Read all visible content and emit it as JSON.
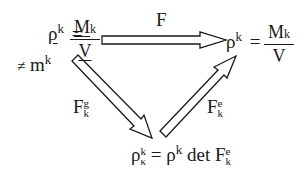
{
  "diagram": {
    "type": "commutative-triangle",
    "nodes": {
      "reference": {
        "symbol": "ρ",
        "sup": "k",
        "equals": "=",
        "numerator": "M",
        "numerator_sub": "k",
        "denominator": "V",
        "underlined": true,
        "note_symbol": "≠",
        "note_var": "m",
        "note_sup": "k"
      },
      "current": {
        "symbol": "ρ",
        "sup": "k",
        "equals": "=",
        "numerator": "M",
        "numerator_sub": "k",
        "denominator": "V"
      },
      "intermediate": {
        "lhs_symbol": "ρ",
        "lhs_sup": "k",
        "lhs_sub": "κ",
        "equals": "=",
        "rhs_symbol": "ρ",
        "rhs_sup": "k",
        "det": "det",
        "F": "F",
        "F_sup": "e",
        "F_sub": "k"
      }
    },
    "arrows": [
      {
        "id": "F",
        "label": "F",
        "label_sup": "",
        "label_sub": "",
        "from": "reference",
        "to": "current"
      },
      {
        "id": "Fg",
        "label": "F",
        "label_sup": "g",
        "label_sub": "k",
        "from": "reference",
        "to": "intermediate"
      },
      {
        "id": "Fe",
        "label": "F",
        "label_sup": "e",
        "label_sub": "k",
        "from": "intermediate",
        "to": "current"
      }
    ]
  }
}
